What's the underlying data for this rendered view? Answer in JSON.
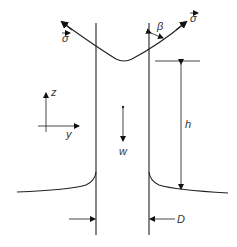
{
  "diagram": {
    "type": "fiber-withdrawal-meniscus",
    "labels": {
      "sigma_left": "σ",
      "sigma_right": "σ",
      "beta": "β",
      "z_axis": "z",
      "y_axis": "y",
      "velocity": "w",
      "height": "h",
      "diameter": "D"
    },
    "colors": {
      "line": "#222222",
      "text": "#333333",
      "background": "#ffffff"
    }
  }
}
